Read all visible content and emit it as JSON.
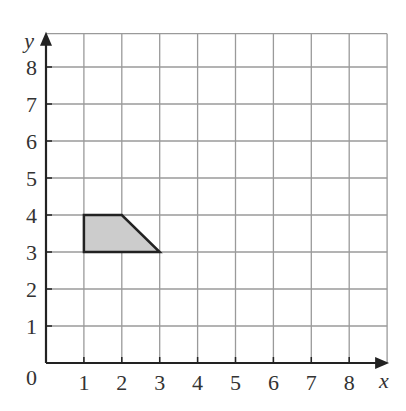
{
  "diagram": {
    "type": "coordinate-grid",
    "x_axis": {
      "label": "x",
      "min": 0,
      "max": 9,
      "ticks": [
        "1",
        "2",
        "3",
        "4",
        "5",
        "6",
        "7",
        "8"
      ]
    },
    "y_axis": {
      "label": "y",
      "min": 0,
      "max": 9,
      "ticks": [
        "1",
        "2",
        "3",
        "4",
        "5",
        "6",
        "7",
        "8"
      ]
    },
    "origin_label": "0",
    "shape": {
      "name": "trapezium",
      "vertices": [
        [
          1,
          3
        ],
        [
          1,
          4
        ],
        [
          2,
          4
        ],
        [
          3,
          3
        ]
      ],
      "fill": "#cccccc",
      "stroke": "#222222"
    },
    "colors": {
      "grid": "#9a9a9a",
      "axis": "#222222"
    }
  }
}
